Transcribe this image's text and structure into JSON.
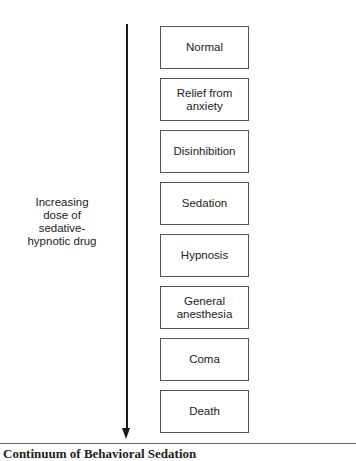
{
  "diagram": {
    "arrow": {
      "direction": "down",
      "label_lines": [
        "Increasing",
        "dose of",
        "sedative-",
        "hypnotic drug"
      ]
    },
    "stages": [
      {
        "lines": [
          "Normal"
        ]
      },
      {
        "lines": [
          "Relief from",
          "anxiety"
        ]
      },
      {
        "lines": [
          "Disinhibition"
        ]
      },
      {
        "lines": [
          "Sedation"
        ]
      },
      {
        "lines": [
          "Hypnosis"
        ]
      },
      {
        "lines": [
          "General",
          "anesthesia"
        ]
      },
      {
        "lines": [
          "Coma"
        ]
      },
      {
        "lines": [
          "Death"
        ]
      }
    ],
    "caption": "Continuum of Behavioral Sedation"
  },
  "colors": {
    "line": "#1a1a1a",
    "box_border": "#555555",
    "text": "#222222",
    "background": "#ffffff"
  }
}
